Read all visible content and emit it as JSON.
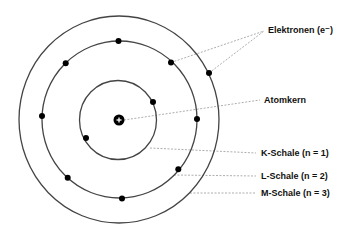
{
  "diagram": {
    "colors": {
      "background": "#ffffff",
      "shell_stroke": "#444444",
      "electron": "#000000",
      "nucleus": "#000000",
      "leader": "#999999",
      "text": "#111111"
    },
    "nucleus": {
      "cx": 119,
      "cy": 120,
      "r": 5.5,
      "symbol": "+"
    },
    "shells": [
      {
        "name": "K",
        "cx": 118,
        "cy": 120,
        "rx": 38.5,
        "ry": 39.5
      },
      {
        "name": "L",
        "cx": 119.5,
        "cy": 119.5,
        "rx": 77.5,
        "ry": 78.5
      },
      {
        "name": "M",
        "cx": 119,
        "cy": 119.5,
        "rx": 100,
        "ry": 103.5
      }
    ],
    "electrons": [
      {
        "shell": "K",
        "x": 153,
        "y": 102
      },
      {
        "shell": "K",
        "x": 86,
        "y": 138
      },
      {
        "shell": "L",
        "x": 118.5,
        "y": 41
      },
      {
        "shell": "L",
        "x": 171,
        "y": 62.5
      },
      {
        "shell": "L",
        "x": 65.7,
        "y": 63.3
      },
      {
        "shell": "L",
        "x": 42,
        "y": 116
      },
      {
        "shell": "L",
        "x": 197,
        "y": 119
      },
      {
        "shell": "L",
        "x": 67.7,
        "y": 177.7
      },
      {
        "shell": "L",
        "x": 178.3,
        "y": 169.3
      },
      {
        "shell": "L",
        "x": 122,
        "y": 198.5
      },
      {
        "shell": "M",
        "x": 209,
        "y": 73
      }
    ],
    "labels": {
      "electrons": "Elektronen (e⁻)",
      "nucleus": "Atomkern",
      "k_shell": "K-Schale (n = 1)",
      "l_shell": "L-Schale (n = 2)",
      "m_shell": "M-Schale (n = 3)"
    },
    "leaders": [
      {
        "target": "electrons",
        "x1": 171,
        "y1": 62.5,
        "x2": 264,
        "y2": 31
      },
      {
        "target": "electrons",
        "x1": 209,
        "y1": 73,
        "x2": 264,
        "y2": 31
      },
      {
        "target": "nucleus",
        "x1": 124,
        "y1": 120,
        "x2": 260,
        "y2": 100
      },
      {
        "target": "k_shell",
        "x1": 150,
        "y1": 148,
        "x2": 256,
        "y2": 153
      },
      {
        "target": "l_shell",
        "x1": 174,
        "y1": 175,
        "x2": 256,
        "y2": 176
      },
      {
        "target": "m_shell",
        "x1": 190,
        "y1": 193,
        "x2": 256,
        "y2": 193
      }
    ]
  }
}
